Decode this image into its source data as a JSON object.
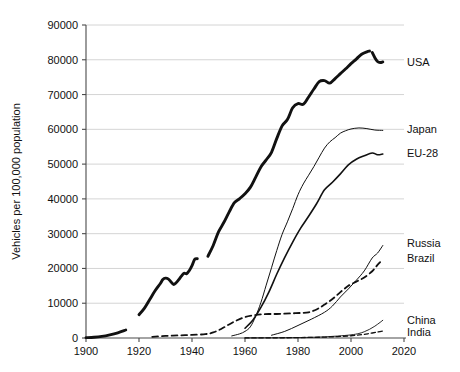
{
  "chart_data": {
    "type": "line",
    "title": "",
    "subtitle": "",
    "xlabel": "",
    "ylabel": "Vehicles per 100,000 population",
    "xlim": [
      1900,
      2020
    ],
    "ylim": [
      0,
      90000
    ],
    "grid": true,
    "legend_position": "inline-right-of-line-ends",
    "x_ticks": [
      1900,
      1920,
      1940,
      1960,
      1980,
      2000,
      2020
    ],
    "x_tick_labels": [
      "1900",
      "1920",
      "1940",
      "1960",
      "1980",
      "2000",
      "2020"
    ],
    "y_ticks": [
      0,
      10000,
      20000,
      30000,
      40000,
      50000,
      60000,
      70000,
      80000,
      90000
    ],
    "y_tick_labels": [
      "0",
      "10000",
      "20000",
      "30000",
      "40000",
      "50000",
      "60000",
      "70000",
      "80000",
      "90000"
    ],
    "series": [
      {
        "name": "USA",
        "label": "USA",
        "style": "solid",
        "width": 2.9,
        "color": "#111111",
        "segments": [
          [
            [
              1900,
              100
            ],
            [
              1903,
              200
            ],
            [
              1906,
              450
            ],
            [
              1909,
              900
            ],
            [
              1912,
              1500
            ],
            [
              1915,
              2300
            ]
          ],
          [
            [
              1920,
              6700
            ],
            [
              1922,
              8500
            ],
            [
              1924,
              11000
            ],
            [
              1926,
              13500
            ],
            [
              1928,
              15600
            ],
            [
              1929,
              16800
            ],
            [
              1930,
              17200
            ],
            [
              1931,
              17000
            ],
            [
              1932,
              16200
            ],
            [
              1933,
              15400
            ],
            [
              1934,
              15900
            ],
            [
              1935,
              16800
            ],
            [
              1936,
              17800
            ],
            [
              1937,
              18600
            ],
            [
              1938,
              18500
            ],
            [
              1939,
              19400
            ],
            [
              1940,
              20800
            ],
            [
              1941,
              22600
            ],
            [
              1942,
              22800
            ]
          ],
          [
            [
              1946,
              23500
            ],
            [
              1948,
              26600
            ],
            [
              1950,
              30500
            ],
            [
              1952,
              33200
            ],
            [
              1954,
              36200
            ],
            [
              1956,
              38900
            ],
            [
              1958,
              40100
            ],
            [
              1960,
              41500
            ],
            [
              1962,
              43300
            ],
            [
              1964,
              46200
            ],
            [
              1966,
              49200
            ],
            [
              1968,
              51200
            ],
            [
              1970,
              53400
            ],
            [
              1972,
              57400
            ],
            [
              1974,
              61000
            ],
            [
              1976,
              62800
            ],
            [
              1978,
              66200
            ],
            [
              1980,
              67400
            ],
            [
              1982,
              67200
            ],
            [
              1984,
              69300
            ],
            [
              1986,
              71600
            ],
            [
              1988,
              73700
            ],
            [
              1990,
              74000
            ],
            [
              1992,
              73300
            ],
            [
              1994,
              74600
            ],
            [
              1996,
              76000
            ],
            [
              1998,
              77400
            ],
            [
              2000,
              78900
            ],
            [
              2002,
              80200
            ],
            [
              2004,
              81600
            ],
            [
              2006,
              82300
            ],
            [
              2007,
              82500
            ]
          ],
          [
            [
              2008,
              82100
            ],
            [
              2009,
              80600
            ],
            [
              2010,
              79500
            ],
            [
              2011,
              79200
            ],
            [
              2012,
              79400
            ]
          ]
        ],
        "label_x": 2021,
        "label_y": 79500
      },
      {
        "name": "Japan",
        "label": "Japan",
        "style": "solid",
        "width": 1.0,
        "color": "#111111",
        "segments": [
          [
            [
              1955,
              600
            ],
            [
              1958,
              1200
            ],
            [
              1960,
              1900
            ],
            [
              1962,
              3200
            ],
            [
              1964,
              6200
            ],
            [
              1966,
              10200
            ],
            [
              1968,
              15200
            ],
            [
              1970,
              20200
            ],
            [
              1972,
              25200
            ],
            [
              1974,
              29800
            ],
            [
              1976,
              33400
            ],
            [
              1978,
              37200
            ],
            [
              1980,
              41200
            ],
            [
              1982,
              44300
            ],
            [
              1984,
              46800
            ],
            [
              1986,
              49300
            ],
            [
              1988,
              52000
            ],
            [
              1990,
              54600
            ],
            [
              1992,
              56400
            ],
            [
              1994,
              57600
            ],
            [
              1996,
              58900
            ],
            [
              1998,
              59600
            ],
            [
              2000,
              60100
            ],
            [
              2003,
              60400
            ],
            [
              2006,
              60200
            ],
            [
              2009,
              59800
            ],
            [
              2012,
              59700
            ]
          ]
        ],
        "label_x": 2021,
        "label_y": 60200
      },
      {
        "name": "EU-28",
        "label": "EU-28",
        "style": "solid",
        "width": 1.6,
        "color": "#111111",
        "segments": [
          [
            [
              1960,
              2800
            ],
            [
              1963,
              5200
            ],
            [
              1966,
              8800
            ],
            [
              1969,
              13200
            ],
            [
              1972,
              18400
            ],
            [
              1975,
              23200
            ],
            [
              1978,
              27600
            ],
            [
              1981,
              31600
            ],
            [
              1984,
              35000
            ],
            [
              1987,
              38600
            ],
            [
              1990,
              42600
            ],
            [
              1993,
              44800
            ],
            [
              1996,
              47200
            ],
            [
              1999,
              49800
            ],
            [
              2002,
              51400
            ],
            [
              2005,
              52400
            ],
            [
              2008,
              53200
            ],
            [
              2010,
              52700
            ],
            [
              2012,
              52900
            ]
          ]
        ],
        "label_x": 2021,
        "label_y": 53200
      },
      {
        "name": "Russia",
        "label": "Russia",
        "style": "solid",
        "width": 1.0,
        "color": "#111111",
        "segments": [
          [
            [
              1970,
              800
            ],
            [
              1975,
              1900
            ],
            [
              1980,
              3600
            ],
            [
              1985,
              5400
            ],
            [
              1990,
              7400
            ],
            [
              1993,
              9200
            ],
            [
              1996,
              11800
            ],
            [
              1999,
              14100
            ],
            [
              2002,
              16600
            ],
            [
              2005,
              19300
            ],
            [
              2008,
              23000
            ],
            [
              2010,
              24400
            ],
            [
              2012,
              26600
            ]
          ]
        ],
        "label_x": 2021,
        "label_y": 27400
      },
      {
        "name": "Brazil",
        "label": "Brazil",
        "style": "dashed",
        "width": 1.8,
        "color": "#111111",
        "segments": [
          [
            [
              1925,
              300
            ],
            [
              1930,
              600
            ],
            [
              1935,
              750
            ],
            [
              1940,
              900
            ],
            [
              1945,
              1100
            ],
            [
              1948,
              1600
            ],
            [
              1951,
              2600
            ],
            [
              1954,
              3900
            ],
            [
              1957,
              5100
            ],
            [
              1960,
              6000
            ],
            [
              1963,
              6500
            ],
            [
              1966,
              6800
            ],
            [
              1969,
              6900
            ],
            [
              1972,
              6900
            ],
            [
              1975,
              7000
            ],
            [
              1978,
              7100
            ],
            [
              1981,
              7200
            ],
            [
              1984,
              7400
            ],
            [
              1987,
              8200
            ],
            [
              1990,
              9600
            ],
            [
              1993,
              11200
            ],
            [
              1996,
              13200
            ],
            [
              1999,
              15000
            ],
            [
              2002,
              16200
            ],
            [
              2005,
              17400
            ],
            [
              2008,
              19200
            ],
            [
              2010,
              21000
            ],
            [
              2012,
              22600
            ]
          ]
        ],
        "label_x": 2021,
        "label_y": 23000
      },
      {
        "name": "China",
        "label": "China",
        "style": "solid",
        "width": 0.9,
        "color": "#111111",
        "segments": [
          [
            [
              1960,
              30
            ],
            [
              1970,
              60
            ],
            [
              1980,
              120
            ],
            [
              1985,
              200
            ],
            [
              1990,
              320
            ],
            [
              1995,
              560
            ],
            [
              2000,
              900
            ],
            [
              2003,
              1300
            ],
            [
              2005,
              1800
            ],
            [
              2007,
              2500
            ],
            [
              2009,
              3400
            ],
            [
              2011,
              4500
            ],
            [
              2012,
              5100
            ]
          ]
        ],
        "label_x": 2021,
        "label_y": 5200
      },
      {
        "name": "India",
        "label": "India",
        "style": "dashed",
        "width": 1.3,
        "color": "#111111",
        "segments": [
          [
            [
              1960,
              20
            ],
            [
              1970,
              50
            ],
            [
              1980,
              110
            ],
            [
              1990,
              260
            ],
            [
              1995,
              420
            ],
            [
              2000,
              650
            ],
            [
              2004,
              950
            ],
            [
              2007,
              1300
            ],
            [
              2010,
              1700
            ],
            [
              2012,
              2000
            ]
          ]
        ],
        "label_x": 2021,
        "label_y": 1800
      }
    ]
  }
}
